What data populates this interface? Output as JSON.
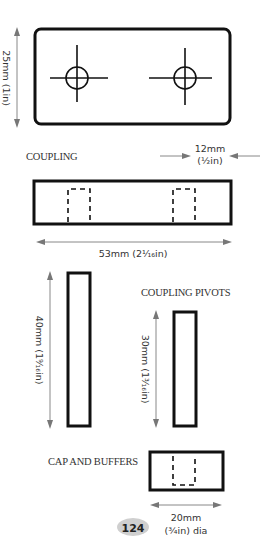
{
  "diagram": {
    "coupling_plate": {
      "height_label": "25mm (1in)",
      "label": "COUPLING",
      "hole_spacing_label_mm": "12mm",
      "hole_spacing_label_in": "(½in)"
    },
    "coupling_side": {
      "length_label": "53mm (2¹⁄₁₆in)"
    },
    "long_bar": {
      "length_label": "40mm (1⁹⁄₁₆in)"
    },
    "coupling_pivots": {
      "label": "COUPLING PIVOTS",
      "length_label": "30mm (1³⁄₁₆in)"
    },
    "cap_and_buffers": {
      "label": "CAP AND BUFFERS",
      "diameter_label_mm": "20mm",
      "diameter_label_in": "(¾in) dia"
    },
    "page_number": "124",
    "colors": {
      "line": "#111111",
      "dimension_arrow": "#888888",
      "page_badge": "#cfcfcf"
    }
  }
}
